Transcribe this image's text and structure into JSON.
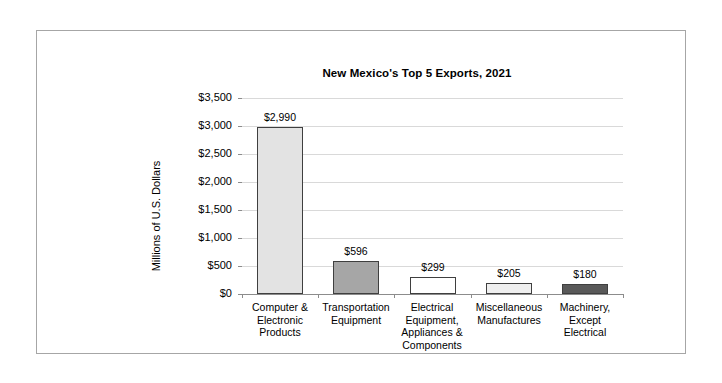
{
  "chart_data": {
    "type": "bar",
    "title": "New Mexico's Top 5 Exports, 2021",
    "xlabel": "",
    "ylabel": "Millions of U.S. Dollars",
    "ylim": [
      0,
      3500
    ],
    "grid": true,
    "legend": "none",
    "categories": [
      "Computer & Electronic Products",
      "Transportation Equipment",
      "Electrical Equipment, Appliances & Components",
      "Miscellaneous Manufactures",
      "Machinery, Except Electrical"
    ],
    "category_lines": [
      [
        "Computer &",
        "Electronic",
        "Products"
      ],
      [
        "Transportation",
        "Equipment"
      ],
      [
        "Electrical",
        "Equipment,",
        "Appliances &",
        "Components"
      ],
      [
        "Miscellaneous",
        "Manufactures"
      ],
      [
        "Machinery,",
        "Except",
        "Electrical"
      ]
    ],
    "values": [
      2990,
      596,
      299,
      205,
      180
    ],
    "data_labels": [
      "$2,990",
      "$596",
      "$299",
      "$205",
      "$180"
    ],
    "bar_colors": [
      "#e3e3e3",
      "#a6a6a6",
      "#ffffff",
      "#efefef",
      "#595959"
    ],
    "bar_border_color": "#3f3f3f",
    "ytick_labels": [
      "$3,500",
      "$3,000",
      "$2,500",
      "$2,000",
      "$1,500",
      "$1,000",
      "$500",
      "$0"
    ],
    "ytick_values": [
      3500,
      3000,
      2500,
      2000,
      1500,
      1000,
      500,
      0
    ],
    "gridline_color": "#d9d9d9",
    "axis_color": "#8c8c8c",
    "frame_color": "#a6a6a6"
  }
}
